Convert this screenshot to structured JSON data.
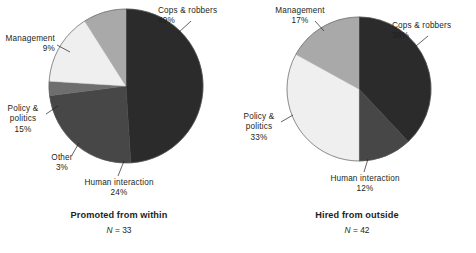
{
  "figure": {
    "background": "#ffffff",
    "panels": [
      {
        "id": "promoted-from-within",
        "caption_title": "Promoted from within",
        "caption_n_symbol": "N",
        "caption_n_equals": "=",
        "caption_n_value": "33"
      },
      {
        "id": "hired-from-outside",
        "caption_title": "Hired from outside",
        "caption_n_symbol": "N",
        "caption_n_equals": "=",
        "caption_n_value": "42"
      }
    ]
  },
  "labels": {
    "left": {
      "cops": {
        "name": "Cops & robbers",
        "pct": "49%"
      },
      "human": {
        "name": "Human interaction",
        "pct": "24%"
      },
      "other": {
        "name": "Other",
        "pct": "3%"
      },
      "policy_l1": "Policy &",
      "policy_l2": "politics",
      "policy_pct": "15%",
      "management": {
        "name": "Management",
        "pct": "9%"
      }
    },
    "right": {
      "cops": {
        "name": "Cops & robbers",
        "pct": "38%"
      },
      "human": {
        "name": "Human interaction",
        "pct": "12%"
      },
      "policy_l1": "Policy &",
      "policy_l2": "politics",
      "policy_pct": "33%",
      "management": {
        "name": "Management",
        "pct": "17%"
      }
    }
  },
  "chart_data": [
    {
      "type": "pie",
      "title": "Promoted from within",
      "subtitle": "N = 33",
      "n": 33,
      "start_angle_deg": 0,
      "direction": "clockwise",
      "legend": "labels-with-leader-lines",
      "categories": [
        "Cops & robbers",
        "Human interaction",
        "Other",
        "Policy & politics",
        "Management"
      ],
      "values": [
        49,
        24,
        3,
        15,
        9
      ],
      "unit": "percent",
      "colors": [
        "#2b2b2b",
        "#474747",
        "#6e6e6e",
        "#efefef",
        "#a9a9a9"
      ],
      "slices": [
        {
          "label": "Cops & robbers",
          "value": 49,
          "pct_text": "49%",
          "color": "#2b2b2b"
        },
        {
          "label": "Human interaction",
          "value": 24,
          "pct_text": "24%",
          "color": "#474747"
        },
        {
          "label": "Other",
          "value": 3,
          "pct_text": "3%",
          "color": "#6e6e6e"
        },
        {
          "label": "Policy & politics",
          "value": 15,
          "pct_text": "15%",
          "color": "#efefef"
        },
        {
          "label": "Management",
          "value": 9,
          "pct_text": "9%",
          "color": "#a9a9a9"
        }
      ]
    },
    {
      "type": "pie",
      "title": "Hired from outside",
      "subtitle": "N = 42",
      "n": 42,
      "start_angle_deg": 0,
      "direction": "clockwise",
      "legend": "labels-with-leader-lines",
      "categories": [
        "Cops & robbers",
        "Human interaction",
        "Policy & politics",
        "Management"
      ],
      "values": [
        38,
        12,
        33,
        17
      ],
      "unit": "percent",
      "colors": [
        "#2b2b2b",
        "#474747",
        "#efefef",
        "#a9a9a9"
      ],
      "slices": [
        {
          "label": "Cops & robbers",
          "value": 38,
          "pct_text": "38%",
          "color": "#2b2b2b"
        },
        {
          "label": "Human interaction",
          "value": 12,
          "pct_text": "12%",
          "color": "#474747"
        },
        {
          "label": "Policy & politics",
          "value": 33,
          "pct_text": "33%",
          "color": "#efefef"
        },
        {
          "label": "Management",
          "value": 17,
          "pct_text": "17%",
          "color": "#a9a9a9"
        }
      ]
    }
  ]
}
